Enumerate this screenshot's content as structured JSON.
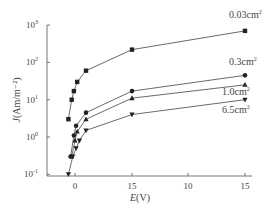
{
  "chart_data": {
    "type": "line",
    "title": "",
    "xlabel": "E(V)",
    "ylabel": "J(Am/m⁻²)",
    "y_scale": "log",
    "ylim": [
      0.1,
      1000
    ],
    "y_ticks": [
      {
        "base": "10",
        "exp": "3",
        "value": 1000
      },
      {
        "base": "10",
        "exp": "2",
        "value": 100
      },
      {
        "base": "10",
        "exp": "1",
        "value": 10
      },
      {
        "base": "10",
        "exp": "0",
        "value": 1
      },
      {
        "base": "10",
        "exp": "-1",
        "value": 0.1
      }
    ],
    "x_ticks": [
      {
        "label": "0",
        "value": 0
      },
      {
        "label": "15",
        "value": 5
      },
      {
        "label": "10",
        "value": 10
      },
      {
        "label": "15",
        "value": 15
      }
    ],
    "xlim": [
      -1.5,
      16
    ],
    "grid": false,
    "legend": "inline labels at right end of each curve",
    "series": [
      {
        "name": "0.03cm²",
        "marker": "square",
        "x": [
          -0.6,
          -0.3,
          -0.1,
          0.2,
          1,
          5,
          15
        ],
        "y": [
          3,
          10,
          17,
          30,
          60,
          220,
          700
        ]
      },
      {
        "name": "0.3cm²",
        "marker": "circle",
        "x": [
          -0.4,
          -0.1,
          0.1,
          1,
          5,
          15
        ],
        "y": [
          0.3,
          1.1,
          2.0,
          4.5,
          17,
          45
        ]
      },
      {
        "name": "1.0cm²",
        "marker": "triangle-up",
        "x": [
          -0.3,
          0,
          0.2,
          1,
          5,
          15
        ],
        "y": [
          0.3,
          0.8,
          1.4,
          3.0,
          11,
          25
        ]
      },
      {
        "name": "6.5cm²",
        "marker": "triangle-down",
        "x": [
          -0.6,
          -0.2,
          0.1,
          0.4,
          1,
          5,
          15
        ],
        "y": [
          0.1,
          0.3,
          0.5,
          0.8,
          1.5,
          4,
          10
        ]
      }
    ]
  }
}
